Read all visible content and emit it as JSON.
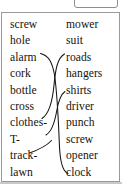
{
  "figure": {
    "left_column": {
      "items": [
        "screw",
        "hole",
        "alarm",
        "cork",
        "bottle",
        "cross",
        "clothes-",
        "T-",
        "track-",
        "lawn"
      ]
    },
    "right_column": {
      "items": [
        "mower",
        "suit",
        "roads",
        "hangers",
        "shirts",
        "driver",
        "punch",
        "screw",
        "opener",
        "clock"
      ]
    },
    "connectors": [
      {
        "from": "alarm",
        "to": "clock"
      },
      {
        "from": "cross",
        "to": "roads"
      },
      {
        "from": "clothes-",
        "to": "shirts"
      },
      {
        "from": "T-",
        "to": "shirts"
      }
    ],
    "ink_color": "#16130f",
    "frame_color": "#9a9a9a",
    "rule_color": "#c9c9c9"
  }
}
